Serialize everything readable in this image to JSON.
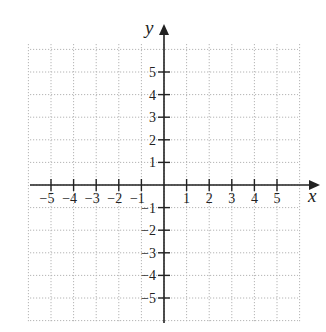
{
  "chart_data": {
    "type": "coordinate-grid",
    "title": "",
    "xlabel": "x",
    "ylabel": "y",
    "xlim": [
      -6,
      6
    ],
    "ylim": [
      -6,
      6
    ],
    "grid": true,
    "grid_style": "dotted",
    "x_ticks": [
      -5,
      -4,
      -3,
      -2,
      -1,
      1,
      2,
      3,
      4,
      5
    ],
    "x_tick_labels": [
      "−5",
      "−4",
      "−3",
      "−2",
      "−1",
      "1",
      "2",
      "3",
      "4",
      "5"
    ],
    "y_ticks": [
      5,
      4,
      3,
      2,
      1,
      -1,
      -2,
      -3,
      -4,
      -5
    ],
    "y_tick_labels": [
      "5",
      "4",
      "3",
      "2",
      "1",
      "−1",
      "−2",
      "−3",
      "−4",
      "−5"
    ],
    "series": [],
    "colors": {
      "axis": "#222222",
      "grid": "#b4b4b4",
      "background": "#ffffff"
    }
  },
  "layout": {
    "origin_px": [
      164,
      185
    ],
    "unit_px": 22.6,
    "grid_left_px": 30,
    "grid_right_px": 298,
    "grid_top_px": 44,
    "grid_bottom_px": 323
  }
}
